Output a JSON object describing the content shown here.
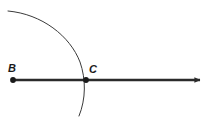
{
  "figure": {
    "kind": "geometry-construction-diagram",
    "width": 211,
    "height": 121,
    "background_color": "#ffffff",
    "stroke_color": "#333333",
    "ray_color": "#2b2b2b",
    "label_color": "#1a1a1a"
  },
  "labels": {
    "point_b": "B",
    "point_c": "C"
  },
  "geometry": {
    "ray": {
      "name": "ray-BC",
      "start_x": 13,
      "start_y": 80,
      "end_x": 206,
      "end_y": 80,
      "stroke_width": 2.6,
      "arrowhead": "right"
    },
    "points": [
      {
        "name": "B",
        "x": 13,
        "y": 80,
        "radius": 2.8
      },
      {
        "name": "C",
        "x": 86,
        "y": 80,
        "radius": 2.8
      }
    ],
    "arc": {
      "name": "compass-arc",
      "start_x": 8,
      "start_y": 11,
      "end_x": 79,
      "end_y": 116,
      "center_x": 13,
      "center_y": 80,
      "radius": 73,
      "stroke_width": 1.0,
      "path": "M 8 11 C 42 14, 70 36, 80 62 C 86 79, 86 99, 79 116"
    }
  },
  "label_positions": {
    "point_b": {
      "x": 12,
      "y": 72
    },
    "point_c": {
      "x": 91,
      "y": 73
    }
  }
}
